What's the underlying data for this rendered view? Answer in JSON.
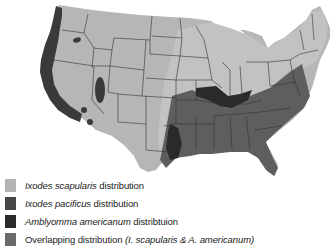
{
  "map": {
    "subject": "United States tick distribution map",
    "colors": {
      "background": "#ffffff",
      "land": "#b4b4b4",
      "ixodes_scapularis": "#b8b8b8",
      "ixodes_pacificus": "#3a3a3a",
      "amblyomma_americanum": "#2a2a2a",
      "overlapping": "#5e5e5e",
      "state_borders": "#333333"
    }
  },
  "legend": {
    "items": [
      {
        "swatch_color": "#b3b3b3",
        "italic": "Ixodes scapularis",
        "text": " distribution",
        "italic2": ""
      },
      {
        "swatch_color": "#474747",
        "italic": "Ixodes pacificus",
        "text": " distribution",
        "italic2": ""
      },
      {
        "swatch_color": "#2b2b2b",
        "italic": "Amblyomma americanum",
        "text": " distribtuion",
        "italic2": ""
      },
      {
        "swatch_color": "#6a6a6a",
        "italic": "",
        "text": "Overlapping distribution ",
        "italic2": "(I. scapularis & A. americanum)"
      }
    ]
  }
}
